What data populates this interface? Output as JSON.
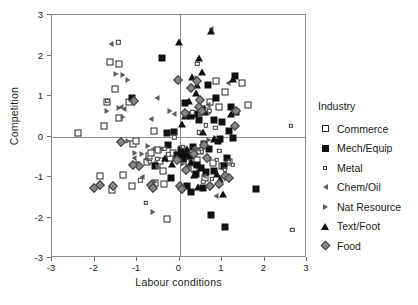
{
  "chart_data": {
    "type": "scatter",
    "title": "",
    "xlabel": "Labour conditions",
    "ylabel": "Competition",
    "xlim": [
      -3,
      3
    ],
    "ylim": [
      -3,
      3
    ],
    "xticks": [
      "-3",
      "-2",
      "-1",
      "0",
      "1",
      "2",
      "3"
    ],
    "xtick_values": [
      -3,
      -2,
      -1,
      0,
      1,
      2,
      3
    ],
    "yticks": [
      "3",
      "2",
      "1",
      "0",
      "-1",
      "-2",
      "-3"
    ],
    "ytick_values": [
      3,
      2,
      1,
      0,
      -1,
      -2,
      -3
    ],
    "grid": false,
    "reference_lines": {
      "x": 0,
      "y": 0
    },
    "legend": {
      "title": "Industry",
      "position": "right",
      "entries": [
        {
          "name": "Commerce",
          "marker": "open-square",
          "color": "#262626"
        },
        {
          "name": "Mech/Equip",
          "marker": "filled-square",
          "color": "#101010"
        },
        {
          "name": "Metal",
          "marker": "small-open-square",
          "color": "#3a3a3a"
        },
        {
          "name": "Chem/Oil",
          "marker": "left-triangle",
          "color": "#5d5d5d"
        },
        {
          "name": "Nat  Resource",
          "marker": "right-triangle",
          "color": "#5d5d5d"
        },
        {
          "name": "Text/Foot",
          "marker": "filled-triangle",
          "color": "#101010"
        },
        {
          "name": "Food",
          "marker": "filled-diamond",
          "color": "#868686"
        }
      ]
    },
    "series": [
      {
        "name": "Commerce",
        "marker": "open-square",
        "points": [
          [
            -2.38,
            0.08
          ],
          [
            -1.63,
            1.84
          ],
          [
            -1.42,
            1.8
          ],
          [
            -1.52,
            1.18
          ],
          [
            -1.7,
            0.86
          ],
          [
            -1.78,
            0.26
          ],
          [
            -1.42,
            0.45
          ],
          [
            -1.86,
            -0.97
          ],
          [
            -1.6,
            -1.32
          ],
          [
            -1.32,
            -0.96
          ],
          [
            -1.12,
            -1.22
          ],
          [
            -1.1,
            -0.18
          ],
          [
            -1.02,
            -0.12
          ],
          [
            -0.76,
            -0.62
          ],
          [
            -0.72,
            -0.48
          ],
          [
            -0.66,
            -0.4
          ],
          [
            -0.6,
            0.14
          ],
          [
            -0.58,
            -1.16
          ],
          [
            -0.54,
            -0.7
          ],
          [
            -0.5,
            -0.33
          ],
          [
            -0.46,
            -0.6
          ],
          [
            -0.4,
            -0.86
          ],
          [
            -0.36,
            -1.18
          ],
          [
            -0.3,
            -2.04
          ],
          [
            -0.22,
            -0.52
          ],
          [
            -0.16,
            -0.4
          ],
          [
            0.06,
            -0.3
          ],
          [
            0.16,
            -0.38
          ],
          [
            0.22,
            -0.62
          ],
          [
            0.3,
            -0.52
          ],
          [
            0.34,
            -0.8
          ],
          [
            0.4,
            -0.58
          ],
          [
            0.48,
            -0.36
          ],
          [
            0.52,
            0.66
          ],
          [
            0.6,
            -1.02
          ],
          [
            0.64,
            0.63
          ],
          [
            0.72,
            0.85
          ],
          [
            0.78,
            -0.66
          ],
          [
            0.86,
            1.36
          ],
          [
            0.92,
            0.74
          ],
          [
            1.0,
            -0.74
          ],
          [
            1.08,
            1.1
          ],
          [
            1.16,
            -0.63
          ],
          [
            1.46,
            1.33
          ],
          [
            1.62,
            0.78
          ],
          [
            -1.2,
            0.84
          ]
        ]
      },
      {
        "name": "Mech/Equip",
        "marker": "filled-square",
        "points": [
          [
            -1.12,
            0.96
          ],
          [
            -0.42,
            1.93
          ],
          [
            -0.3,
            0.08
          ],
          [
            -0.26,
            -0.2
          ],
          [
            -0.2,
            -1.03
          ],
          [
            -0.12,
            0.11
          ],
          [
            -0.05,
            -0.46
          ],
          [
            0.0,
            -0.5
          ],
          [
            0.04,
            -0.33
          ],
          [
            0.08,
            -0.55
          ],
          [
            0.1,
            -0.42
          ],
          [
            0.14,
            0.83
          ],
          [
            0.18,
            -1.22
          ],
          [
            0.22,
            0.53
          ],
          [
            0.24,
            -0.48
          ],
          [
            0.28,
            -1.36
          ],
          [
            0.32,
            -0.26
          ],
          [
            0.36,
            0.55
          ],
          [
            0.38,
            -0.92
          ],
          [
            0.42,
            -0.7
          ],
          [
            0.46,
            0.4
          ],
          [
            0.5,
            -0.78
          ],
          [
            0.52,
            0.67
          ],
          [
            0.56,
            -1.28
          ],
          [
            0.58,
            -0.18
          ],
          [
            0.62,
            -0.88
          ],
          [
            0.66,
            1.26
          ],
          [
            0.7,
            -0.3
          ],
          [
            0.74,
            -1.94
          ],
          [
            0.8,
            0.4
          ],
          [
            0.82,
            -0.84
          ],
          [
            0.86,
            0.96
          ],
          [
            0.9,
            -0.12
          ],
          [
            0.96,
            -0.06
          ],
          [
            1.0,
            0.36
          ],
          [
            1.04,
            -0.72
          ],
          [
            1.08,
            -2.23
          ],
          [
            1.12,
            -0.53
          ],
          [
            1.16,
            0.14
          ],
          [
            1.22,
            0.72
          ],
          [
            1.26,
            -0.04
          ],
          [
            1.3,
            1.5
          ],
          [
            1.34,
            0.6
          ],
          [
            1.8,
            -1.29
          ],
          [
            -0.58,
            -0.74
          ],
          [
            0.26,
            0.5
          ]
        ]
      },
      {
        "name": "Metal",
        "marker": "small-open-square",
        "points": [
          [
            -1.44,
            2.33
          ],
          [
            -1.7,
            0.88
          ],
          [
            -0.92,
            -1.08
          ],
          [
            -0.8,
            -1.64
          ],
          [
            -0.7,
            -0.62
          ],
          [
            -0.52,
            -0.55
          ],
          [
            -0.36,
            -0.3
          ],
          [
            -0.12,
            -0.02
          ],
          [
            0.08,
            -0.26
          ],
          [
            0.3,
            0.6
          ],
          [
            0.36,
            -0.36
          ],
          [
            0.42,
            1.79
          ],
          [
            0.46,
            0.1
          ],
          [
            0.52,
            -0.38
          ],
          [
            0.56,
            -1.12
          ],
          [
            0.62,
            0.28
          ],
          [
            0.7,
            0.63
          ],
          [
            0.76,
            -1.05
          ],
          [
            0.84,
            0.22
          ],
          [
            0.88,
            -0.58
          ],
          [
            0.94,
            -0.36
          ],
          [
            1.06,
            -0.82
          ],
          [
            1.16,
            -0.62
          ],
          [
            1.26,
            -0.7
          ],
          [
            2.62,
            0.26
          ],
          [
            2.65,
            -2.31
          ],
          [
            -0.26,
            -0.44
          ]
        ]
      },
      {
        "name": "Chem/Oil",
        "marker": "left-triangle",
        "points": [
          [
            -1.62,
            2.29
          ],
          [
            -1.38,
            0.72
          ],
          [
            -1.3,
            0.68
          ],
          [
            -1.08,
            -0.52
          ],
          [
            -0.88,
            -1.0
          ],
          [
            -0.68,
            0.42
          ],
          [
            -0.62,
            -0.3
          ],
          [
            -0.52,
            0.96
          ],
          [
            -0.34,
            -0.58
          ],
          [
            -0.14,
            0.55
          ],
          [
            0.26,
            1.21
          ],
          [
            0.34,
            -0.28
          ],
          [
            0.44,
            -0.3
          ],
          [
            0.58,
            -0.98
          ],
          [
            0.66,
            0.78
          ],
          [
            0.74,
            2.66
          ],
          [
            0.86,
            -1.46
          ],
          [
            1.14,
            1.33
          ],
          [
            -0.78,
            -0.56
          ],
          [
            0.2,
            -0.72
          ]
        ]
      },
      {
        "name": "Nat  Resource",
        "marker": "right-triangle",
        "points": [
          [
            -1.5,
            1.54
          ],
          [
            -1.34,
            1.52
          ],
          [
            -1.22,
            1.4
          ],
          [
            -1.7,
            0.63
          ],
          [
            -1.42,
            0.7
          ],
          [
            -1.32,
            0.48
          ],
          [
            -1.22,
            -0.12
          ],
          [
            -1.04,
            -0.4
          ],
          [
            -0.98,
            -0.66
          ],
          [
            -1.06,
            -0.68
          ],
          [
            -0.74,
            -0.24
          ],
          [
            -0.62,
            -1.86
          ],
          [
            -0.58,
            -1.12
          ],
          [
            -0.5,
            -0.76
          ],
          [
            -0.42,
            -0.32
          ],
          [
            -0.22,
            0.62
          ],
          [
            0.08,
            -0.68
          ],
          [
            0.4,
            1.44
          ],
          [
            0.5,
            0.53
          ],
          [
            0.6,
            -0.25
          ],
          [
            0.7,
            -0.08
          ],
          [
            0.86,
            -0.04
          ],
          [
            -0.88,
            -0.42
          ]
        ]
      },
      {
        "name": "Text/Foot",
        "marker": "filled-triangle",
        "points": [
          [
            -0.02,
            2.33
          ],
          [
            0.46,
            1.93
          ],
          [
            0.74,
            2.6
          ],
          [
            0.52,
            1.6
          ],
          [
            0.3,
            1.47
          ],
          [
            0.42,
            1.26
          ],
          [
            0.38,
            1.07
          ],
          [
            0.22,
            0.88
          ],
          [
            0.14,
            0.5
          ],
          [
            0.06,
            0.3
          ],
          [
            0.56,
            0.12
          ],
          [
            0.6,
            0.6
          ],
          [
            0.82,
            -0.06
          ],
          [
            0.88,
            -0.92
          ],
          [
            0.96,
            -1.04
          ],
          [
            1.02,
            -1.42
          ],
          [
            0.18,
            -0.3
          ],
          [
            0.26,
            -0.62
          ],
          [
            0.34,
            -0.96
          ],
          [
            0.44,
            -1.24
          ],
          [
            -0.34,
            -0.54
          ],
          [
            -0.18,
            -0.68
          ],
          [
            1.22,
            0.56
          ],
          [
            1.26,
            1.42
          ]
        ]
      },
      {
        "name": "Food",
        "marker": "filled-diamond",
        "points": [
          [
            -2.02,
            -1.28
          ],
          [
            -1.86,
            -1.2
          ],
          [
            -1.56,
            -1.22
          ],
          [
            -1.38,
            -0.14
          ],
          [
            -1.08,
            0.88
          ],
          [
            -0.96,
            -0.74
          ],
          [
            -0.66,
            -1.2
          ],
          [
            -0.62,
            -1.26
          ],
          [
            -0.04,
            1.39
          ],
          [
            -0.06,
            -0.58
          ],
          [
            0.02,
            -1.22
          ],
          [
            0.06,
            -1.3
          ],
          [
            0.16,
            -0.82
          ],
          [
            0.12,
            0.58
          ],
          [
            0.26,
            1.2
          ],
          [
            0.4,
            1.37
          ],
          [
            0.48,
            0.9
          ],
          [
            0.46,
            0.72
          ],
          [
            0.54,
            0.63
          ],
          [
            0.58,
            -0.22
          ],
          [
            0.64,
            -0.52
          ],
          [
            0.72,
            -1.22
          ],
          [
            0.92,
            -1.18
          ],
          [
            1.08,
            -0.98
          ],
          [
            1.16,
            -1.02
          ],
          [
            1.3,
            0.26
          ],
          [
            1.34,
            0.64
          ],
          [
            -1.1,
            -0.7
          ],
          [
            0.34,
            -0.44
          ]
        ]
      }
    ]
  }
}
